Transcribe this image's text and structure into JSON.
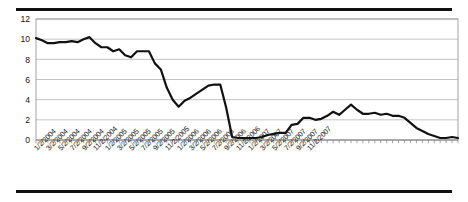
{
  "figure": {
    "top_rule": "horizontal-rule",
    "bottom_rule": "horizontal-rule"
  },
  "chart_data": {
    "type": "line",
    "title": "",
    "subtitle": "",
    "xlabel": "",
    "ylabel": "",
    "ylim": [
      0,
      12
    ],
    "yticks": [
      0,
      2,
      4,
      6,
      8,
      10,
      12
    ],
    "ytick_labels": [
      "0",
      "2",
      "4",
      "6",
      "8",
      "10",
      "12"
    ],
    "grid": true,
    "grid_axis": "y",
    "legend": false,
    "legend_position": "none",
    "line_color": "#111111",
    "line_width": 2.2,
    "markers": false,
    "x_label_rotation": -45,
    "x_label_interval": 2,
    "xtick_labels": [
      "1/2/2004",
      "3/2/2004",
      "5/2/2004",
      "7/2/2004",
      "9/2/2004",
      "11/2/2004",
      "1/2/2005",
      "3/2/2005",
      "5/2/2005",
      "7/2/2005",
      "9/2/2005",
      "11/2/2005",
      "1/2/2006",
      "3/2/2006",
      "5/2/2006",
      "7/2/2006",
      "9/2/2006",
      "11/2/2006",
      "1/2/2007",
      "3/2/2007",
      "5/2/2007",
      "7/2/2007",
      "9/2/2007",
      "11/2/2007"
    ],
    "x": [
      "1/2/2004",
      "2/2/2004",
      "3/2/2004",
      "4/2/2004",
      "5/2/2004",
      "6/2/2004",
      "7/2/2004",
      "8/2/2004",
      "9/2/2004",
      "10/2/2004",
      "11/2/2004",
      "12/2/2004",
      "1/2/2005",
      "2/2/2005",
      "3/2/2005",
      "4/2/2005",
      "5/2/2005",
      "6/2/2005",
      "7/2/2005",
      "8/2/2005",
      "9/2/2005",
      "10/2/2005",
      "11/2/2005",
      "12/2/2005",
      "1/2/2006",
      "2/2/2006",
      "3/2/2006",
      "4/2/2006",
      "5/2/2006",
      "6/2/2006",
      "7/2/2006",
      "8/2/2006",
      "9/2/2006",
      "10/2/2006",
      "11/2/2006",
      "12/2/2006",
      "1/2/2007",
      "2/2/2007",
      "3/2/2007",
      "4/2/2007",
      "5/2/2007",
      "6/2/2007",
      "7/2/2007",
      "8/2/2007",
      "9/2/2007",
      "10/2/2007",
      "11/2/2007",
      "12/2/2007"
    ],
    "values": [
      10.1,
      9.9,
      9.6,
      9.6,
      9.7,
      9.7,
      9.8,
      9.7,
      10.0,
      10.2,
      9.6,
      9.2,
      9.2,
      8.8,
      9.0,
      8.4,
      8.2,
      8.8,
      8.8,
      8.8,
      7.6,
      7.0,
      5.2,
      4.0,
      3.3,
      3.9,
      4.2,
      4.6,
      5.0,
      5.4,
      5.5,
      5.5,
      3.2,
      0.3,
      0.2,
      0.2,
      0.2,
      0.2,
      0.3,
      0.5,
      0.6,
      0.7,
      0.7,
      1.5,
      1.6,
      2.2,
      2.2,
      2.0
    ],
    "values_tail": [
      2.1,
      2.4,
      2.8,
      2.5,
      3.0,
      3.5,
      3.0,
      2.6,
      2.6,
      2.7,
      2.5,
      2.6,
      2.4,
      2.4,
      2.2,
      1.7,
      1.2,
      0.9,
      0.6,
      0.4,
      0.2,
      0.2,
      0.3,
      0.2
    ]
  }
}
